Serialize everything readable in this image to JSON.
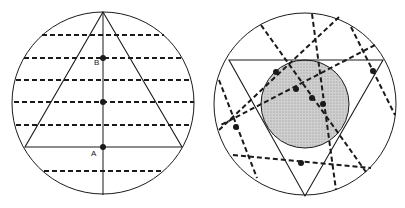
{
  "figure": {
    "left_panel": {
      "circle": {
        "cx": 103,
        "cy": 103,
        "r": 91
      },
      "triangle": {
        "points": [
          [
            103,
            12
          ],
          [
            25,
            147
          ],
          [
            182,
            147
          ]
        ]
      },
      "axis_line": {
        "x1": 103,
        "y1": 12,
        "x2": 103,
        "y2": 195
      },
      "dashed_lines": [
        {
          "x1": 42,
          "y1": 35,
          "x2": 164,
          "y2": 35
        },
        {
          "x1": 24,
          "y1": 58,
          "x2": 184,
          "y2": 58
        },
        {
          "x1": 16,
          "y1": 80,
          "x2": 192,
          "y2": 80
        },
        {
          "x1": 14,
          "y1": 102,
          "x2": 194,
          "y2": 102
        },
        {
          "x1": 16,
          "y1": 125,
          "x2": 192,
          "y2": 125
        },
        {
          "x1": 44,
          "y1": 171,
          "x2": 164,
          "y2": 171
        }
      ],
      "points": [
        {
          "name": "B",
          "cx": 103,
          "cy": 58
        },
        {
          "name": "mid",
          "cx": 103,
          "cy": 102
        },
        {
          "name": "A",
          "cx": 103,
          "cy": 147
        }
      ],
      "labels": [
        {
          "text": "B",
          "x": 94,
          "y": 58
        },
        {
          "text": "A",
          "x": 91,
          "y": 149
        }
      ]
    },
    "right_panel": {
      "circle": {
        "cx": 305,
        "cy": 104,
        "r": 91
      },
      "shaded_circle": {
        "cx": 305,
        "cy": 104,
        "r": 44,
        "fill": "#c8c8c8"
      },
      "triangle": {
        "points": [
          [
            229,
            60
          ],
          [
            383,
            60
          ],
          [
            305,
            196
          ]
        ]
      },
      "dashed_lines": [
        {
          "x1": 261,
          "y1": 25,
          "x2": 366,
          "y2": 172
        },
        {
          "x1": 312,
          "y1": 14,
          "x2": 336,
          "y2": 190
        },
        {
          "x1": 339,
          "y1": 17,
          "x2": 219,
          "y2": 130
        },
        {
          "x1": 375,
          "y1": 45,
          "x2": 219,
          "y2": 126
        },
        {
          "x1": 351,
          "y1": 27,
          "x2": 395,
          "y2": 115
        },
        {
          "x1": 219,
          "y1": 80,
          "x2": 257,
          "y2": 178
        },
        {
          "x1": 233,
          "y1": 155,
          "x2": 371,
          "y2": 168
        }
      ],
      "points": [
        {
          "cx": 276,
          "cy": 72
        },
        {
          "cx": 296,
          "cy": 89
        },
        {
          "cx": 312,
          "cy": 98
        },
        {
          "cx": 323,
          "cy": 104
        },
        {
          "cx": 373,
          "cy": 71
        },
        {
          "cx": 236,
          "cy": 127
        },
        {
          "cx": 301,
          "cy": 163
        }
      ]
    },
    "colors": {
      "stroke": "#1a1a1a",
      "background": "#ffffff",
      "shade": "#c8c8c8"
    }
  }
}
